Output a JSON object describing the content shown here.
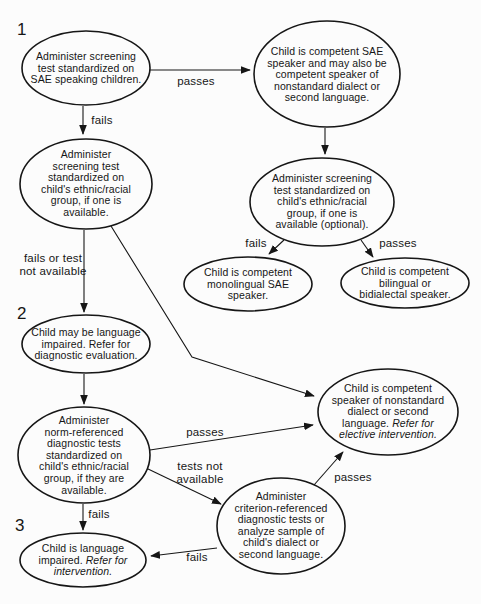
{
  "diagram": {
    "ink_color": "#161616",
    "background_color": "#fcfcfc",
    "sections": {
      "one": "1",
      "two": "2",
      "three": "3"
    },
    "nodes": {
      "screen_sae": {
        "text": "Administer screening\ntest standardized on\nSAE speaking children."
      },
      "competent_sae": {
        "text": "Child is competent SAE\nspeaker and may also be\ncompetent speaker of\nnonstandard dialect or\nsecond language."
      },
      "screen_ethnic": {
        "text": "Administer\nscreening test\nstandardized on\nchild's ethnic/racial\ngroup, if one is\navailable."
      },
      "screen_ethnic_optional": {
        "text": "Administer screening\ntest standardized on\nchild's ethnic/racial\ngroup, if one is\navailable (optional)."
      },
      "monolingual_sae": {
        "text": "Child is competent\nmonolingual SAE\nspeaker."
      },
      "bilingual": {
        "text": "Child is competent\nbilingual or\nbidialectal speaker."
      },
      "may_be_impaired": {
        "text": "Child may be language\nimpaired. Refer for\ndiagnostic evaluation."
      },
      "norm_referenced": {
        "text": "Administer\nnorm-referenced\ndiagnostic tests\nstandardized on\nchild's ethnic/racial\ngroup, if they are\navailable."
      },
      "impaired": {
        "text": "Child is language\nimpaired. ",
        "italic": "Refer for\nintervention."
      },
      "criterion_referenced": {
        "text": "Administer\ncriterion-referenced\ndiagnostic tests or\nanalyze sample of\nchild's dialect or\nsecond language."
      },
      "nonstandard_speaker": {
        "text": "Child is competent\nspeaker of nonstandard\ndialect or second\nlanguage. ",
        "italic": "Refer for\nelective intervention."
      }
    },
    "edge_labels": {
      "screen_sae_passes": "passes",
      "screen_sae_fails": "fails",
      "screen_ethnic_fails": "fails or test\nnot available",
      "optional_fails": "fails",
      "optional_passes": "passes",
      "norm_passes": "passes",
      "norm_tests_not_available": "tests not\navailable",
      "norm_fails": "fails",
      "criterion_passes": "passes",
      "criterion_fails": "fails"
    }
  }
}
